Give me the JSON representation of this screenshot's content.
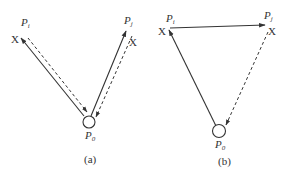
{
  "colors": {
    "stroke": "#333333",
    "background": "#ffffff"
  },
  "panels": [
    {
      "id": "a",
      "caption": "(a)",
      "nodes": {
        "pi": {
          "label": "P",
          "sub": "i",
          "marker": "X"
        },
        "pj": {
          "label": "P",
          "sub": "j",
          "marker": "X"
        },
        "p0": {
          "label": "P",
          "sub": "0"
        }
      },
      "edges": [
        {
          "from": "P0",
          "to": "Pi",
          "style": "solid"
        },
        {
          "from": "Pi",
          "to": "P0",
          "style": "dashed"
        },
        {
          "from": "P0",
          "to": "Pj",
          "style": "solid"
        },
        {
          "from": "Pj",
          "to": "P0",
          "style": "dashed"
        }
      ]
    },
    {
      "id": "b",
      "caption": "(b)",
      "nodes": {
        "pi": {
          "label": "P",
          "sub": "i",
          "marker": "X"
        },
        "pj": {
          "label": "P",
          "sub": "j",
          "marker": "X"
        },
        "p0": {
          "label": "P",
          "sub": "0"
        }
      },
      "edges": [
        {
          "from": "P0",
          "to": "Pi",
          "style": "solid"
        },
        {
          "from": "Pi",
          "to": "Pj",
          "style": "solid"
        },
        {
          "from": "Pj",
          "to": "P0",
          "style": "dashed"
        }
      ]
    }
  ]
}
